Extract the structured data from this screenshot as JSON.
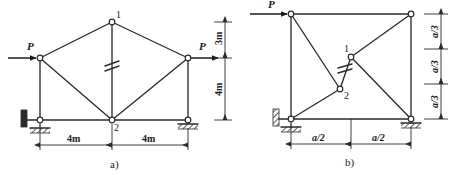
{
  "figure": {
    "title_caption_a": "a)",
    "title_caption_b": "b)",
    "panel_a": {
      "name": "truss-diagram-a",
      "forces": [
        {
          "label": "P",
          "position": "left-node",
          "direction": "right"
        },
        {
          "label": "P",
          "position": "right-node",
          "direction": "right"
        }
      ],
      "node_labels": [
        {
          "id": "1",
          "position": "apex-top-center"
        },
        {
          "id": "2",
          "position": "bottom-center"
        }
      ],
      "dimensions_horizontal": [
        {
          "label": "4m",
          "span": "left-support-to-node-2"
        },
        {
          "label": "4m",
          "span": "node-2-to-right-support"
        }
      ],
      "dimensions_vertical": [
        {
          "label": "3m",
          "span": "apex-to-side-node"
        },
        {
          "label": "4m",
          "span": "side-node-to-base"
        }
      ],
      "member_marks": [
        {
          "type": "double-slash",
          "member": "apex-to-bottom-center-vertical"
        }
      ],
      "supports": [
        {
          "type": "pin-roller-wall",
          "position": "bottom-left"
        },
        {
          "type": "roller-ground",
          "position": "bottom-right"
        }
      ]
    },
    "panel_b": {
      "name": "truss-diagram-b",
      "forces": [
        {
          "label": "P",
          "position": "top-left-node",
          "direction": "right"
        }
      ],
      "node_labels": [
        {
          "id": "1",
          "position": "mid-upper-center"
        },
        {
          "id": "2",
          "position": "mid-lower-center"
        }
      ],
      "dimensions_horizontal": [
        {
          "label": "a/2",
          "span": "left-to-center"
        },
        {
          "label": "a/2",
          "span": "center-to-right"
        }
      ],
      "dimensions_vertical": [
        {
          "label": "a/3",
          "span": "top-third"
        },
        {
          "label": "a/3",
          "span": "middle-third"
        },
        {
          "label": "a/3",
          "span": "bottom-third"
        }
      ],
      "member_marks": [
        {
          "type": "double-slash",
          "member": "node-1-to-node-2-vertical"
        }
      ],
      "supports": [
        {
          "type": "pin-roller-wall",
          "position": "bottom-left"
        },
        {
          "type": "roller-ground",
          "position": "bottom-right"
        }
      ]
    },
    "colors": {
      "line": "#2b2b2b",
      "background": "#ffffff",
      "text": "#1a1a1a"
    }
  }
}
